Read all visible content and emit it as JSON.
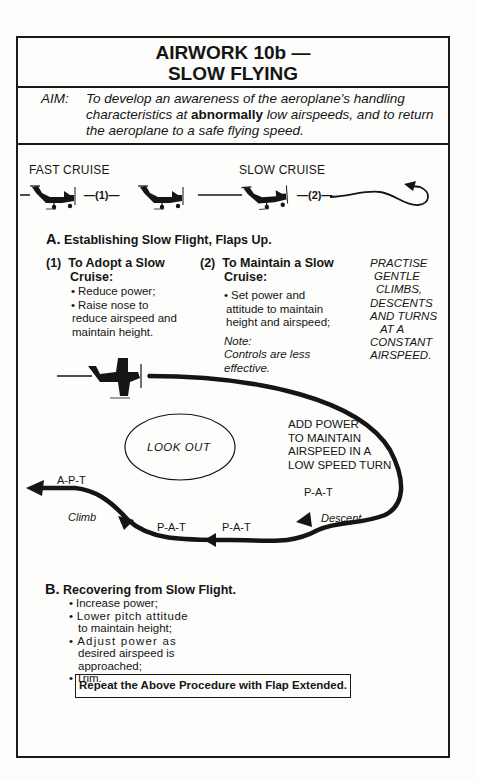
{
  "header": {
    "title_line1": "AIRWORK 10b —",
    "title_line2": "SLOW FLYING"
  },
  "aim": {
    "label": "AIM:",
    "text_before": "To develop an awareness of the aeroplane's handling characteristics at ",
    "text_bold": "abnormally",
    "text_after": " low airspeeds, and to return the aeroplane to a safe flying speed."
  },
  "cruise_diagram": {
    "fast_cruise_label": "FAST CRUISE",
    "slow_cruise_label": "SLOW CRUISE",
    "marker_1": "—(1)—",
    "marker_2": "—(2)—"
  },
  "section_a": {
    "letter": "A.",
    "heading": "Establishing Slow Flight, Flaps Up.",
    "col1": {
      "number": "(1)",
      "heading_line1": "To Adopt a Slow",
      "heading_line2": "Cruise:",
      "bullets": [
        "Reduce power;",
        "Raise nose to",
        "reduce airspeed and",
        "maintain height."
      ]
    },
    "col2": {
      "number": "(2)",
      "heading_line1": "To Maintain a Slow",
      "heading_line2": "Cruise:",
      "bullet_lines": [
        "Set power and",
        "attitude to maintain",
        "height and airspeed;"
      ],
      "note_label": "Note:",
      "note_lines": [
        "Controls are less",
        "effective."
      ]
    },
    "col3_lines": [
      "PRACTISE",
      "GENTLE",
      "CLIMBS,",
      "DESCENTS",
      "AND TURNS",
      "AT A",
      "CONSTANT",
      "AIRSPEED."
    ]
  },
  "turn_diagram": {
    "look_out": "LOOK OUT",
    "add_power_lines": [
      "ADD POWER",
      "TO MAINTAIN",
      "AIRSPEED IN A",
      "LOW SPEED TURN"
    ],
    "apt": "A-P-T",
    "climb": "Climb",
    "pat_1": "P-A-T",
    "pat_2": "P-A-T",
    "pat_3": "P-A-T",
    "descent": "Descent"
  },
  "section_b": {
    "letter": "B.",
    "heading": "Recovering from Slow Flight.",
    "lines": [
      {
        "bullet": true,
        "text": "Increase power;"
      },
      {
        "bullet": true,
        "text": "Lower pitch attitude"
      },
      {
        "bullet": false,
        "text": "to maintain height;"
      },
      {
        "bullet": true,
        "text": "Adjust power as"
      },
      {
        "bullet": false,
        "text": "desired airspeed is"
      },
      {
        "bullet": false,
        "text": "approached;"
      },
      {
        "bullet": true,
        "text": "Trim."
      }
    ]
  },
  "footer_note": "Repeat the Above Procedure with Flap Extended.",
  "colors": {
    "ink": "#151515",
    "paper": "#fdfdfb"
  }
}
